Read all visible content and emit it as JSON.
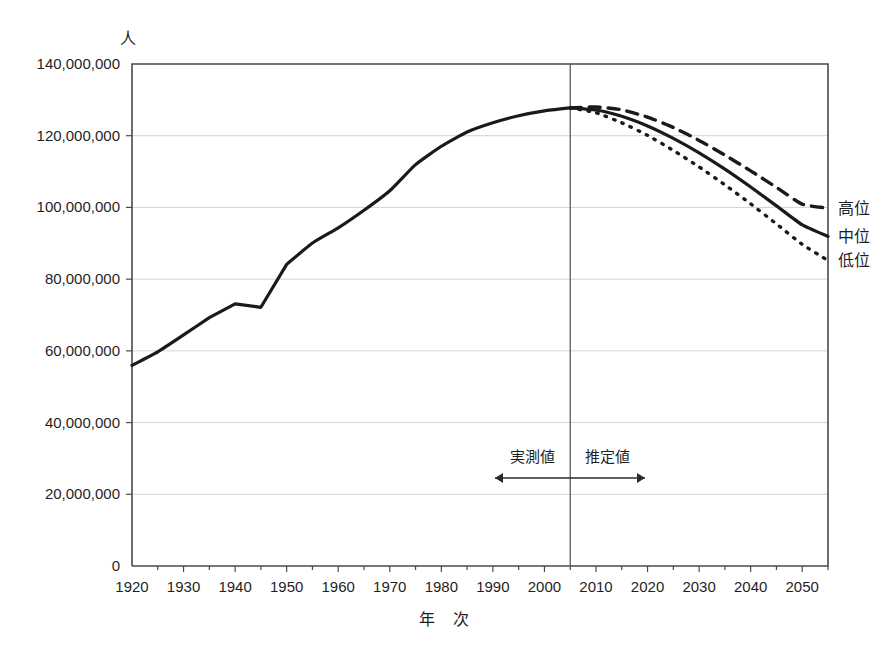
{
  "chart_data": {
    "type": "line",
    "title": "",
    "xlabel": "年  次",
    "ylabel": "人",
    "xlim": [
      1920,
      2055
    ],
    "ylim": [
      0,
      140000000
    ],
    "grid": true,
    "legend_position": "right",
    "x_ticks": [
      1920,
      1930,
      1940,
      1950,
      1960,
      1970,
      1980,
      1990,
      2000,
      2010,
      2020,
      2030,
      2040,
      2050
    ],
    "x_tick_labels": [
      "1920",
      "1930",
      "1940",
      "1950",
      "1960",
      "1970",
      "1980",
      "1990",
      "2000",
      "2010",
      "2020",
      "2030",
      "2040",
      "2050"
    ],
    "y_ticks": [
      0,
      20000000,
      40000000,
      60000000,
      80000000,
      100000000,
      120000000,
      140000000
    ],
    "y_tick_labels": [
      "0",
      "20,000,000",
      "40,000,000",
      "60,000,000",
      "80,000,000",
      "100,000,000",
      "120,000,000",
      "140,000,000"
    ],
    "minor_x_tick_interval": 5,
    "divider_year": 2005,
    "series": [
      {
        "name": "実測値",
        "style": "solid",
        "color": "#1a1a1a",
        "x": [
          1920,
          1925,
          1930,
          1935,
          1940,
          1945,
          1950,
          1955,
          1960,
          1965,
          1970,
          1975,
          1980,
          1985,
          1990,
          1995,
          2000,
          2005
        ],
        "values": [
          55963000,
          59737000,
          64450000,
          69254000,
          73114000,
          72147000,
          84115000,
          90077000,
          94302000,
          99209000,
          104665000,
          111940000,
          117060000,
          121049000,
          123611000,
          125570000,
          126926000,
          127768000
        ]
      },
      {
        "name": "高位",
        "style": "dashed",
        "color": "#1a1a1a",
        "x": [
          2005,
          2010,
          2015,
          2020,
          2025,
          2030,
          2035,
          2040,
          2045,
          2050,
          2055
        ],
        "values": [
          127768000,
          128016000,
          127234000,
          125200000,
          122300000,
          118700000,
          114600000,
          110200000,
          105600000,
          100900000,
          99800000
        ]
      },
      {
        "name": "中位",
        "style": "solid",
        "color": "#1a1a1a",
        "x": [
          2005,
          2010,
          2015,
          2020,
          2025,
          2030,
          2035,
          2040,
          2045,
          2050,
          2055
        ],
        "values": [
          127768000,
          127176000,
          125430000,
          122735000,
          119270000,
          115224000,
          110679000,
          105695000,
          100443000,
          95152000,
          91933000
        ]
      },
      {
        "name": "低位",
        "style": "dotted",
        "color": "#1a1a1a",
        "x": [
          2005,
          2010,
          2015,
          2020,
          2025,
          2030,
          2035,
          2040,
          2045,
          2050,
          2055
        ],
        "values": [
          127768000,
          126400000,
          123600000,
          120100000,
          115900000,
          111300000,
          106300000,
          101000000,
          95400000,
          89700000,
          85200000
        ]
      }
    ],
    "annotations": [
      {
        "name": "observed",
        "label": "実測値",
        "arrow": "left"
      },
      {
        "name": "estimated",
        "label": "推定値",
        "arrow": "right"
      }
    ],
    "legend_entries": [
      {
        "label": "高位",
        "style": "dashed"
      },
      {
        "label": "中位",
        "style": "solid"
      },
      {
        "label": "低位",
        "style": "dotted"
      }
    ]
  }
}
